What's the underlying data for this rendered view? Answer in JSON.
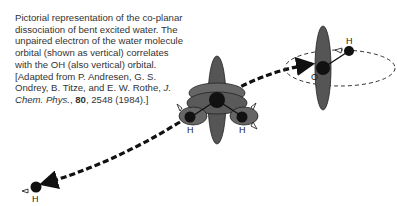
{
  "caption": {
    "text_main": "Pictorial representation of the co-planar dissociation of bent excited water. The unpaired electron of the water molecule orbital (shown as vertical) correlates with the OH (also vertical) orbital. [Adapted from P. Andresen, G. S. Ondrey, B. Titze, and E. W. Rothe, ",
    "journal": "J. Chem. Phys.",
    "sep1": ", ",
    "volume": "80",
    "rest": ", 2548 (1984).]"
  },
  "diagram": {
    "labels": {
      "h_left_molecule": "H",
      "h_right_molecule": "H",
      "oh_hydrogen": "H",
      "oh_oxygen": "O",
      "free_hydrogen": "H"
    }
  }
}
